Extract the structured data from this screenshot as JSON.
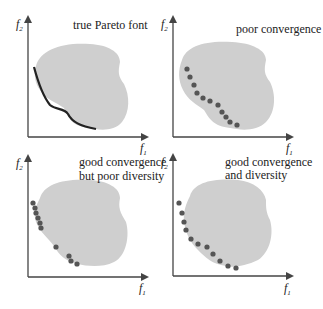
{
  "figure": {
    "panels": [
      {
        "id": "true-front",
        "title_lines": [
          "true Pareto font"
        ],
        "x_label": "f",
        "x_sub": "1",
        "y_label": "f",
        "y_sub": "2",
        "front": "curve"
      },
      {
        "id": "poor-convergence",
        "title_lines": [
          "poor convergence"
        ],
        "x_label": "f",
        "x_sub": "1",
        "y_label": "f",
        "y_sub": "2",
        "front": "points"
      },
      {
        "id": "good-conv-poor-div",
        "title_lines": [
          "good convergence",
          "but poor diversity"
        ],
        "x_label": "f",
        "x_sub": "1",
        "y_label": "f",
        "y_sub": "2",
        "front": "points"
      },
      {
        "id": "good-conv-div",
        "title_lines": [
          "good convergence",
          "and diversity"
        ],
        "x_label": "f",
        "x_sub": "1",
        "y_label": "f",
        "y_sub": "2",
        "front": "points"
      }
    ],
    "colors": {
      "region": "#cfcfcf",
      "axis": "#444444",
      "point": "#555555",
      "curve": "#222222"
    }
  }
}
